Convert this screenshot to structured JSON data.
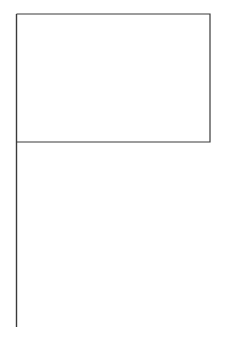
{
  "figure": {
    "name": "flag-line-drawing",
    "canvas": {
      "width": 230,
      "height": 337,
      "background_color": "#ffffff"
    },
    "style": {
      "stroke_color": "#3a3a3a",
      "stroke_width": 1.2,
      "fill_color": "#ffffff"
    },
    "parts": {
      "pole": {
        "label": "Flag pole",
        "x": 16.5,
        "y_top": 14,
        "y_bottom": 327,
        "stroke_color": "#3a3a3a",
        "stroke_width": 1.4
      },
      "banner": {
        "label": "Flag banner",
        "x_left": 16.5,
        "x_right": 210,
        "y_top": 14,
        "y_bottom": 142,
        "width": 193.5,
        "height": 128,
        "stroke_color": "#3a3a3a",
        "stroke_width": 1.2,
        "fill_color": "#ffffff"
      }
    }
  }
}
